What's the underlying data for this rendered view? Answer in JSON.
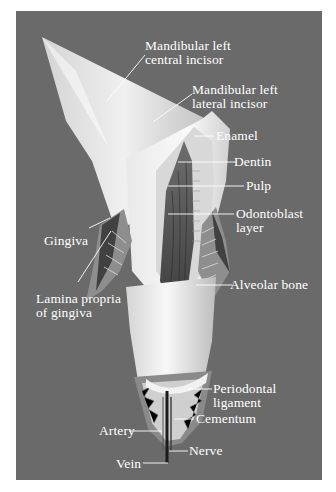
{
  "figure": {
    "colors": {
      "background": "#6a6a6a",
      "enamel": "#f4f4f4",
      "label_text": "#ffffff",
      "page": "#ffffff"
    },
    "labels": [
      {
        "id": "central-incisor",
        "lines": [
          "Mandibular left",
          "central incisor"
        ]
      },
      {
        "id": "lateral-incisor",
        "lines": [
          "Mandibular left",
          "lateral incisor"
        ]
      },
      {
        "id": "enamel",
        "lines": [
          "Enamel"
        ]
      },
      {
        "id": "dentin",
        "lines": [
          "Dentin"
        ]
      },
      {
        "id": "pulp",
        "lines": [
          "Pulp"
        ]
      },
      {
        "id": "odontoblast-layer",
        "lines": [
          "Odontoblast",
          "layer"
        ]
      },
      {
        "id": "gingiva",
        "lines": [
          "Gingiva"
        ]
      },
      {
        "id": "alveolar-bone",
        "lines": [
          "Alveolar bone"
        ]
      },
      {
        "id": "lamina-propria",
        "lines": [
          "Lamina propria",
          "of gingiva"
        ]
      },
      {
        "id": "periodontal-ligament",
        "lines": [
          "Periodontal",
          "ligament"
        ]
      },
      {
        "id": "cementum",
        "lines": [
          "Cementum"
        ]
      },
      {
        "id": "artery",
        "lines": [
          "Artery"
        ]
      },
      {
        "id": "nerve",
        "lines": [
          "Nerve"
        ]
      },
      {
        "id": "vein",
        "lines": [
          "Vein"
        ]
      }
    ]
  }
}
